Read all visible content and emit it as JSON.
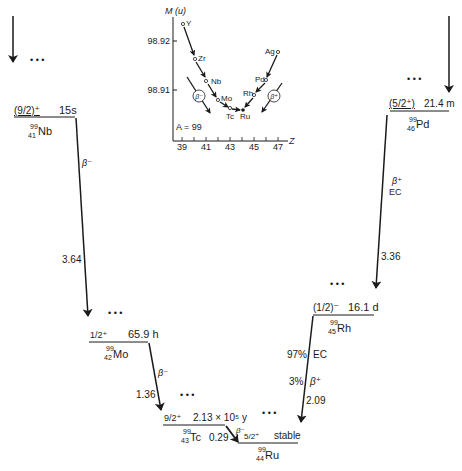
{
  "inset": {
    "y_axis_label": "M (u)",
    "y_ticks": [
      "98.92",
      "98.91"
    ],
    "x_axis_label": "Z",
    "x_ticks": [
      "39",
      "41",
      "43",
      "45",
      "47"
    ],
    "mass_number_label": "A = 99",
    "beta_minus_label": "β⁻",
    "beta_plus_label": "β⁺",
    "elements": [
      "Y",
      "Zr",
      "Nb",
      "Mo",
      "Tc",
      "Ru",
      "Rh",
      "Pd",
      "Ag"
    ]
  },
  "levels": {
    "nb": {
      "spin": "(9/2)⁺",
      "halflife": "15s",
      "mass": "99",
      "z": "41",
      "symbol": "Nb"
    },
    "pd": {
      "spin": "(5/2⁺)",
      "halflife": "21.4 m",
      "mass": "99",
      "z": "46",
      "symbol": "Pd"
    },
    "mo": {
      "spin": "1/2⁺",
      "halflife": "65.9 h",
      "mass": "99",
      "z": "42",
      "symbol": "Mo"
    },
    "rh": {
      "spin": "(1/2)⁻",
      "halflife": "16.1 d",
      "mass": "99",
      "z": "45",
      "symbol": "Rh"
    },
    "tc": {
      "spin": "9/2⁺",
      "halflife": "2.13 × 10⁵ y",
      "mass": "99",
      "z": "43",
      "symbol": "Tc"
    },
    "ru": {
      "spin": "5/2⁺",
      "halflife": "stable",
      "mass": "99",
      "z": "44",
      "symbol": "Ru"
    }
  },
  "transitions": {
    "nb_mo": {
      "mode": "β⁻",
      "q": "3.64"
    },
    "mo_tc": {
      "mode": "β⁻",
      "q": "1.36"
    },
    "tc_ru": {
      "mode": "β⁻",
      "q": "0.29"
    },
    "pd_rh": {
      "mode1": "β⁺",
      "mode2": "EC",
      "q": "3.36"
    },
    "rh_ru": {
      "ec_pct": "97%",
      "ec": "EC",
      "bp_pct": "3%",
      "bp": "β⁺",
      "q": "2.09"
    }
  },
  "ellipsis": "• • •"
}
